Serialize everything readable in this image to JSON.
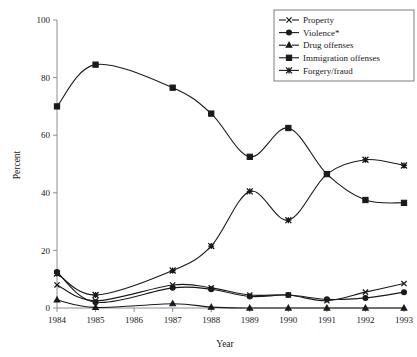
{
  "chart_data": {
    "type": "line",
    "title": "",
    "xlabel": "Year",
    "ylabel": "Percent",
    "x": [
      1984,
      1985,
      1986,
      1987,
      1988,
      1989,
      1990,
      1991,
      1992,
      1993
    ],
    "categories": [
      "1984",
      "1985",
      "1986",
      "1987",
      "1988",
      "1989",
      "1990",
      "1991",
      "1992",
      "1993"
    ],
    "xlim": [
      1984,
      1993
    ],
    "ylim": [
      0,
      100
    ],
    "yticks": [
      0,
      20,
      40,
      60,
      80,
      100
    ],
    "ytick_labels": [
      "0",
      "20",
      "40",
      "60",
      "80",
      "100"
    ],
    "grid": false,
    "legend_position": "top-right",
    "note": "No data markers plotted at 1986; lines interpolate through that year.",
    "series": [
      {
        "name": "Property",
        "marker": "x",
        "values": [
          8.0,
          2.5,
          null,
          8.0,
          7.0,
          4.5,
          4.5,
          2.5,
          5.5,
          8.5
        ]
      },
      {
        "name": "Violence*",
        "marker": "circle",
        "values": [
          12.5,
          2.0,
          null,
          7.0,
          6.5,
          4.0,
          4.5,
          3.0,
          3.5,
          5.5
        ]
      },
      {
        "name": "Drug offenses",
        "marker": "triangle",
        "values": [
          2.8,
          0.2,
          null,
          1.5,
          0.3,
          0.0,
          0.0,
          0.0,
          0.0,
          0.0
        ]
      },
      {
        "name": "Immigration offenses",
        "marker": "square",
        "values": [
          70.0,
          84.5,
          null,
          76.5,
          67.5,
          52.5,
          62.5,
          46.5,
          37.5,
          36.5
        ]
      },
      {
        "name": "Forgery/fraud",
        "marker": "asterisk",
        "values": [
          12.0,
          4.5,
          null,
          13.0,
          21.5,
          40.5,
          30.5,
          46.5,
          51.5,
          49.5
        ]
      }
    ],
    "colors": {
      "ink": "#1a1a1a",
      "axis": "#8e8e8e",
      "background": "#ffffff"
    }
  },
  "legend": {
    "entries": [
      {
        "label": "Property"
      },
      {
        "label": "Violence*"
      },
      {
        "label": "Drug offenses"
      },
      {
        "label": "Immigration offenses"
      },
      {
        "label": "Forgery/fraud"
      }
    ]
  }
}
